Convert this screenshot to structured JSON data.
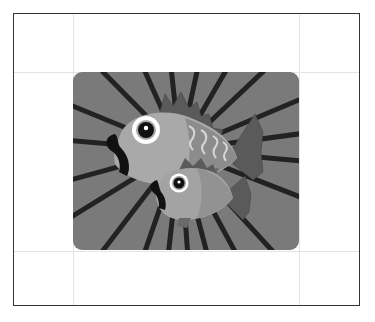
{
  "illustration": {
    "subject": "Two cartoon fish on a radial sunburst background",
    "fish": [
      {
        "name": "large-fish",
        "position": "upper"
      },
      {
        "name": "small-fish",
        "position": "lower"
      }
    ],
    "ray_count": 24
  },
  "colors": {
    "frame_border": "#333333",
    "guide_lines": "#e4e4e4",
    "background_gray": "#7a7a7a",
    "ray_dark": "#222222",
    "fish_body": "#a9a9a9",
    "fish_shadow": "#8c8c8c",
    "fin_dark": "#5a5a5a",
    "scale_light": "#d6d6d6",
    "eye_white": "#ffffff",
    "pupil": "#111111"
  }
}
